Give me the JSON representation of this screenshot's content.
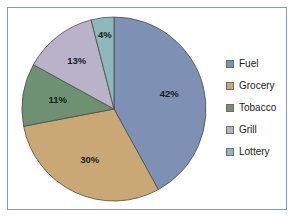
{
  "frame": {
    "border_color": "#8a9bb0",
    "background": "#ffffff"
  },
  "chart_data": {
    "type": "pie",
    "title": "",
    "legend_position": "right",
    "start_angle_deg": 0,
    "direction": "clockwise",
    "categories": [
      "Fuel",
      "Grocery",
      "Tobacco",
      "Grill",
      "Lottery"
    ],
    "values": [
      42,
      30,
      11,
      13,
      4
    ],
    "labels": [
      "42%",
      "30%",
      "11%",
      "13%",
      "4%"
    ],
    "colors": [
      "#7e91b4",
      "#c9a875",
      "#6f9173",
      "#b9b2c9",
      "#8fb8bc"
    ],
    "unit": "percent",
    "total": 100
  },
  "legend": {
    "items": [
      {
        "label": "Fuel",
        "color": "#7e91b4"
      },
      {
        "label": "Grocery",
        "color": "#c9a875"
      },
      {
        "label": "Tobacco",
        "color": "#6f9173"
      },
      {
        "label": "Grill",
        "color": "#b9b2c9"
      },
      {
        "label": "Lottery",
        "color": "#8fb8bc"
      }
    ]
  }
}
